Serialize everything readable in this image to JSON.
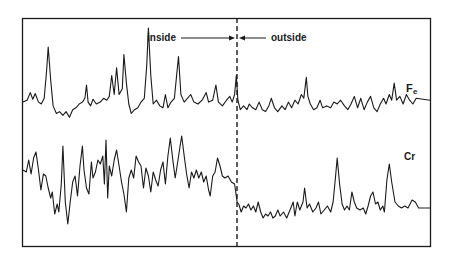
{
  "chart_data": {
    "type": "line",
    "title": "",
    "xlabel": "",
    "ylabel": "",
    "grid": false,
    "legend": "none",
    "annotations": {
      "boundary_label_left": "inside",
      "boundary_label_right": "outside",
      "boundary_position_fraction": 0.527
    },
    "x_range": [
      0,
      1
    ],
    "series": [
      {
        "name": "Fe",
        "label": "Fe",
        "note": "upper trace; y is relative signal (0 = trace baseline bottom, higher = larger peak)",
        "points": [
          [
            0.0,
            0.22
          ],
          [
            0.01,
            0.24
          ],
          [
            0.018,
            0.32
          ],
          [
            0.024,
            0.25
          ],
          [
            0.03,
            0.31
          ],
          [
            0.038,
            0.22
          ],
          [
            0.045,
            0.2
          ],
          [
            0.052,
            0.26
          ],
          [
            0.058,
            0.55
          ],
          [
            0.062,
            0.8
          ],
          [
            0.068,
            0.45
          ],
          [
            0.074,
            0.18
          ],
          [
            0.082,
            0.1
          ],
          [
            0.09,
            0.12
          ],
          [
            0.098,
            0.08
          ],
          [
            0.106,
            0.12
          ],
          [
            0.114,
            0.06
          ],
          [
            0.122,
            0.14
          ],
          [
            0.13,
            0.16
          ],
          [
            0.138,
            0.2
          ],
          [
            0.146,
            0.22
          ],
          [
            0.152,
            0.26
          ],
          [
            0.156,
            0.4
          ],
          [
            0.16,
            0.22
          ],
          [
            0.166,
            0.18
          ],
          [
            0.172,
            0.25
          ],
          [
            0.18,
            0.2
          ],
          [
            0.19,
            0.22
          ],
          [
            0.198,
            0.26
          ],
          [
            0.206,
            0.24
          ],
          [
            0.212,
            0.28
          ],
          [
            0.218,
            0.5
          ],
          [
            0.224,
            0.3
          ],
          [
            0.23,
            0.58
          ],
          [
            0.236,
            0.3
          ],
          [
            0.244,
            0.36
          ],
          [
            0.248,
            0.72
          ],
          [
            0.254,
            0.42
          ],
          [
            0.26,
            0.2
          ],
          [
            0.266,
            0.1
          ],
          [
            0.274,
            0.14
          ],
          [
            0.282,
            0.16
          ],
          [
            0.29,
            0.22
          ],
          [
            0.298,
            0.26
          ],
          [
            0.304,
            0.6
          ],
          [
            0.308,
            1.0
          ],
          [
            0.314,
            0.5
          ],
          [
            0.32,
            0.2
          ],
          [
            0.328,
            0.24
          ],
          [
            0.336,
            0.18
          ],
          [
            0.344,
            0.16
          ],
          [
            0.35,
            0.3
          ],
          [
            0.356,
            0.16
          ],
          [
            0.364,
            0.22
          ],
          [
            0.372,
            0.26
          ],
          [
            0.378,
            0.52
          ],
          [
            0.382,
            0.7
          ],
          [
            0.388,
            0.3
          ],
          [
            0.396,
            0.22
          ],
          [
            0.404,
            0.26
          ],
          [
            0.412,
            0.3
          ],
          [
            0.42,
            0.22
          ],
          [
            0.43,
            0.2
          ],
          [
            0.44,
            0.24
          ],
          [
            0.45,
            0.32
          ],
          [
            0.456,
            0.22
          ],
          [
            0.466,
            0.24
          ],
          [
            0.474,
            0.4
          ],
          [
            0.48,
            0.22
          ],
          [
            0.49,
            0.18
          ],
          [
            0.5,
            0.24
          ],
          [
            0.508,
            0.28
          ],
          [
            0.514,
            0.22
          ],
          [
            0.52,
            0.3
          ],
          [
            0.524,
            0.5
          ],
          [
            0.528,
            0.24
          ],
          [
            0.534,
            0.14
          ],
          [
            0.542,
            0.18
          ],
          [
            0.55,
            0.14
          ],
          [
            0.556,
            0.2
          ],
          [
            0.564,
            0.16
          ],
          [
            0.572,
            0.14
          ],
          [
            0.58,
            0.22
          ],
          [
            0.588,
            0.14
          ],
          [
            0.596,
            0.12
          ],
          [
            0.604,
            0.18
          ],
          [
            0.61,
            0.26
          ],
          [
            0.618,
            0.16
          ],
          [
            0.626,
            0.12
          ],
          [
            0.636,
            0.18
          ],
          [
            0.644,
            0.14
          ],
          [
            0.652,
            0.22
          ],
          [
            0.66,
            0.16
          ],
          [
            0.668,
            0.24
          ],
          [
            0.676,
            0.2
          ],
          [
            0.684,
            0.3
          ],
          [
            0.69,
            0.26
          ],
          [
            0.696,
            0.48
          ],
          [
            0.7,
            0.28
          ],
          [
            0.706,
            0.2
          ],
          [
            0.714,
            0.14
          ],
          [
            0.722,
            0.16
          ],
          [
            0.73,
            0.24
          ],
          [
            0.736,
            0.16
          ],
          [
            0.746,
            0.18
          ],
          [
            0.756,
            0.16
          ],
          [
            0.764,
            0.22
          ],
          [
            0.772,
            0.2
          ],
          [
            0.78,
            0.24
          ],
          [
            0.79,
            0.18
          ],
          [
            0.798,
            0.14
          ],
          [
            0.806,
            0.2
          ],
          [
            0.814,
            0.28
          ],
          [
            0.822,
            0.16
          ],
          [
            0.83,
            0.26
          ],
          [
            0.838,
            0.14
          ],
          [
            0.846,
            0.22
          ],
          [
            0.854,
            0.28
          ],
          [
            0.862,
            0.16
          ],
          [
            0.87,
            0.12
          ],
          [
            0.878,
            0.2
          ],
          [
            0.886,
            0.26
          ],
          [
            0.892,
            0.2
          ],
          [
            0.9,
            0.3
          ],
          [
            0.906,
            0.24
          ],
          [
            0.912,
            0.42
          ],
          [
            0.918,
            0.24
          ],
          [
            0.926,
            0.28
          ],
          [
            0.934,
            0.2
          ],
          [
            0.942,
            0.3
          ],
          [
            0.95,
            0.24
          ],
          [
            0.958,
            0.2
          ],
          [
            0.966,
            0.26
          ],
          [
            1.0,
            0.24
          ]
        ]
      },
      {
        "name": "Cr",
        "label": "Cr",
        "note": "lower trace; y is relative signal",
        "points": [
          [
            0.0,
            0.62
          ],
          [
            0.008,
            0.6
          ],
          [
            0.014,
            0.72
          ],
          [
            0.02,
            0.58
          ],
          [
            0.026,
            0.74
          ],
          [
            0.032,
            0.8
          ],
          [
            0.038,
            0.62
          ],
          [
            0.044,
            0.42
          ],
          [
            0.05,
            0.58
          ],
          [
            0.056,
            0.56
          ],
          [
            0.062,
            0.44
          ],
          [
            0.068,
            0.34
          ],
          [
            0.072,
            0.4
          ],
          [
            0.078,
            0.18
          ],
          [
            0.084,
            0.28
          ],
          [
            0.088,
            0.2
          ],
          [
            0.094,
            0.48
          ],
          [
            0.098,
            0.86
          ],
          [
            0.104,
            0.3
          ],
          [
            0.11,
            0.08
          ],
          [
            0.116,
            0.3
          ],
          [
            0.122,
            0.5
          ],
          [
            0.128,
            0.56
          ],
          [
            0.134,
            0.36
          ],
          [
            0.14,
            0.66
          ],
          [
            0.146,
            0.86
          ],
          [
            0.15,
            0.62
          ],
          [
            0.156,
            0.44
          ],
          [
            0.162,
            0.38
          ],
          [
            0.168,
            0.7
          ],
          [
            0.172,
            0.54
          ],
          [
            0.178,
            0.6
          ],
          [
            0.184,
            0.72
          ],
          [
            0.19,
            0.68
          ],
          [
            0.196,
            0.76
          ],
          [
            0.2,
            0.48
          ],
          [
            0.204,
            0.92
          ],
          [
            0.208,
            0.34
          ],
          [
            0.212,
            0.66
          ],
          [
            0.218,
            0.56
          ],
          [
            0.224,
            0.72
          ],
          [
            0.23,
            0.82
          ],
          [
            0.236,
            0.66
          ],
          [
            0.242,
            0.5
          ],
          [
            0.248,
            0.38
          ],
          [
            0.254,
            0.2
          ],
          [
            0.26,
            0.54
          ],
          [
            0.266,
            0.62
          ],
          [
            0.272,
            0.54
          ],
          [
            0.278,
            0.76
          ],
          [
            0.284,
            0.7
          ],
          [
            0.29,
            0.66
          ],
          [
            0.296,
            0.44
          ],
          [
            0.302,
            0.64
          ],
          [
            0.308,
            0.56
          ],
          [
            0.314,
            0.4
          ],
          [
            0.32,
            0.6
          ],
          [
            0.326,
            0.52
          ],
          [
            0.332,
            0.46
          ],
          [
            0.338,
            0.62
          ],
          [
            0.344,
            0.7
          ],
          [
            0.35,
            0.48
          ],
          [
            0.356,
            0.76
          ],
          [
            0.362,
            0.94
          ],
          [
            0.368,
            0.72
          ],
          [
            0.374,
            0.54
          ],
          [
            0.38,
            0.7
          ],
          [
            0.386,
            0.86
          ],
          [
            0.39,
            0.96
          ],
          [
            0.396,
            0.76
          ],
          [
            0.402,
            0.58
          ],
          [
            0.408,
            0.44
          ],
          [
            0.414,
            0.6
          ],
          [
            0.42,
            0.54
          ],
          [
            0.426,
            0.62
          ],
          [
            0.432,
            0.54
          ],
          [
            0.438,
            0.6
          ],
          [
            0.444,
            0.5
          ],
          [
            0.45,
            0.56
          ],
          [
            0.456,
            0.42
          ],
          [
            0.46,
            0.36
          ],
          [
            0.466,
            0.56
          ],
          [
            0.472,
            0.6
          ],
          [
            0.478,
            0.74
          ],
          [
            0.484,
            0.66
          ],
          [
            0.49,
            0.56
          ],
          [
            0.496,
            0.54
          ],
          [
            0.504,
            0.56
          ],
          [
            0.512,
            0.5
          ],
          [
            0.52,
            0.48
          ],
          [
            0.526,
            0.3
          ],
          [
            0.53,
            0.28
          ],
          [
            0.536,
            0.2
          ],
          [
            0.542,
            0.26
          ],
          [
            0.548,
            0.24
          ],
          [
            0.554,
            0.28
          ],
          [
            0.56,
            0.22
          ],
          [
            0.566,
            0.26
          ],
          [
            0.572,
            0.2
          ],
          [
            0.578,
            0.3
          ],
          [
            0.584,
            0.2
          ],
          [
            0.59,
            0.14
          ],
          [
            0.596,
            0.18
          ],
          [
            0.602,
            0.16
          ],
          [
            0.608,
            0.2
          ],
          [
            0.614,
            0.14
          ],
          [
            0.62,
            0.16
          ],
          [
            0.626,
            0.22
          ],
          [
            0.632,
            0.16
          ],
          [
            0.64,
            0.2
          ],
          [
            0.648,
            0.14
          ],
          [
            0.656,
            0.22
          ],
          [
            0.664,
            0.3
          ],
          [
            0.668,
            0.16
          ],
          [
            0.674,
            0.3
          ],
          [
            0.68,
            0.22
          ],
          [
            0.688,
            0.3
          ],
          [
            0.692,
            0.44
          ],
          [
            0.698,
            0.24
          ],
          [
            0.704,
            0.28
          ],
          [
            0.712,
            0.2
          ],
          [
            0.72,
            0.24
          ],
          [
            0.726,
            0.3
          ],
          [
            0.732,
            0.18
          ],
          [
            0.74,
            0.22
          ],
          [
            0.748,
            0.26
          ],
          [
            0.756,
            0.2
          ],
          [
            0.762,
            0.3
          ],
          [
            0.768,
            0.56
          ],
          [
            0.772,
            0.74
          ],
          [
            0.778,
            0.48
          ],
          [
            0.784,
            0.28
          ],
          [
            0.79,
            0.22
          ],
          [
            0.796,
            0.26
          ],
          [
            0.802,
            0.22
          ],
          [
            0.808,
            0.4
          ],
          [
            0.814,
            0.3
          ],
          [
            0.82,
            0.24
          ],
          [
            0.828,
            0.22
          ],
          [
            0.836,
            0.24
          ],
          [
            0.842,
            0.18
          ],
          [
            0.848,
            0.26
          ],
          [
            0.854,
            0.36
          ],
          [
            0.86,
            0.4
          ],
          [
            0.866,
            0.28
          ],
          [
            0.872,
            0.3
          ],
          [
            0.878,
            0.22
          ],
          [
            0.884,
            0.26
          ],
          [
            0.888,
            0.2
          ],
          [
            0.894,
            0.52
          ],
          [
            0.9,
            0.68
          ],
          [
            0.906,
            0.5
          ],
          [
            0.914,
            0.3
          ],
          [
            0.922,
            0.26
          ],
          [
            0.93,
            0.24
          ],
          [
            0.938,
            0.26
          ],
          [
            0.946,
            0.24
          ],
          [
            0.956,
            0.32
          ],
          [
            0.964,
            0.3
          ],
          [
            0.972,
            0.24
          ],
          [
            1.0,
            0.24
          ]
        ]
      }
    ]
  },
  "labels": {
    "inside": "inside",
    "outside": "outside",
    "fe_main": "F",
    "fe_sub": "e",
    "cr": "Cr"
  },
  "colors": {
    "trace": "#1a1a1a",
    "frame": "#1a1a1a",
    "background": "#ffffff"
  }
}
